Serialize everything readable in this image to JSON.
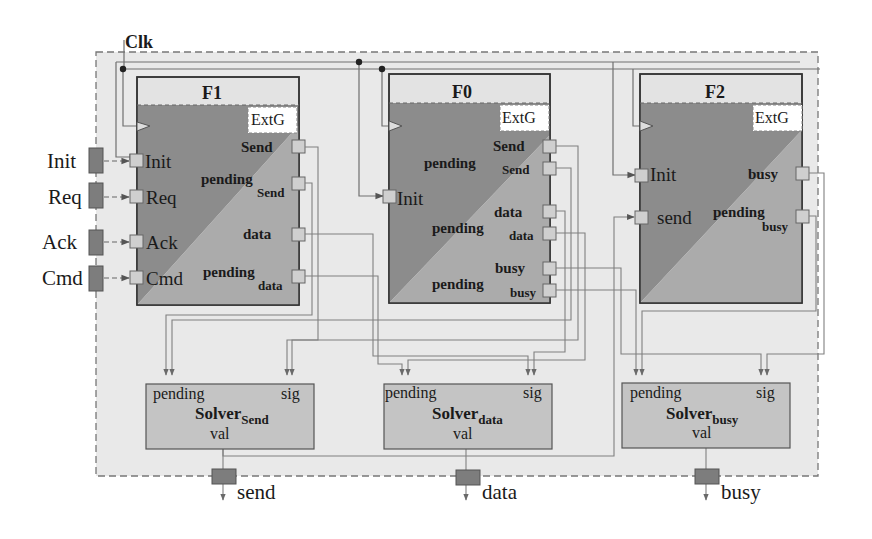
{
  "diagram": {
    "clock_label": "Clk",
    "external_inputs": [
      {
        "label": "Init"
      },
      {
        "label": "Req"
      },
      {
        "label": "Ack"
      },
      {
        "label": "Cmd"
      }
    ],
    "blocks": [
      {
        "id": "F1",
        "title": "F1",
        "badge": "ExtG",
        "inputs": [
          "Init",
          "Req",
          "Ack",
          "Cmd"
        ],
        "outputs": [
          {
            "main": "Send",
            "sub": ""
          },
          {
            "main": "pending",
            "sub": "Send"
          },
          {
            "main": "data",
            "sub": ""
          },
          {
            "main": "pending",
            "sub": "data"
          }
        ]
      },
      {
        "id": "F0",
        "title": "F0",
        "badge": "ExtG",
        "inputs": [
          "Init"
        ],
        "outputs": [
          {
            "main": "Send",
            "sub": ""
          },
          {
            "main": "pending",
            "sub": "Send"
          },
          {
            "main": "data",
            "sub": ""
          },
          {
            "main": "pending",
            "sub": "data"
          },
          {
            "main": "busy",
            "sub": ""
          },
          {
            "main": "pending",
            "sub": "busy"
          }
        ]
      },
      {
        "id": "F2",
        "title": "F2",
        "badge": "ExtG",
        "inputs": [
          "Init",
          "send"
        ],
        "outputs": [
          {
            "main": "busy",
            "sub": ""
          },
          {
            "main": "pending",
            "sub": "busy"
          }
        ]
      }
    ],
    "solvers": [
      {
        "name": "Solver",
        "subscript": "Send",
        "port_pending": "pending",
        "port_sig": "sig",
        "port_val": "val",
        "output": "send"
      },
      {
        "name": "Solver",
        "subscript": "data",
        "port_pending": "pending",
        "port_sig": "sig",
        "port_val": "val",
        "output": "data"
      },
      {
        "name": "Solver",
        "subscript": "busy",
        "port_pending": "pending",
        "port_sig": "sig",
        "port_val": "val",
        "output": "busy"
      }
    ],
    "colors": {
      "container_bg": "#e9e9e9",
      "block_header": "#e3e3e3",
      "block_dark": "#8c8c8c",
      "block_light": "#a9a9a9",
      "port": "#cfcfcf",
      "io_marker": "#7d7d7d",
      "solver_bg": "#c4c4c4",
      "wire": "#7a7a7a"
    }
  }
}
